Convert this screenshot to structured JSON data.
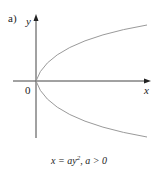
{
  "figure": {
    "panel_label": "a)",
    "axes": {
      "x_label": "x",
      "y_label": "y",
      "origin_label": "0"
    },
    "curve": {
      "name": "parabola opening right",
      "equation_prefix": "x = ay",
      "exponent": "2",
      "condition": ", a > 0"
    },
    "colors": {
      "axis": "#444444",
      "curve": "#9a9a9a",
      "text": "#222222"
    }
  }
}
